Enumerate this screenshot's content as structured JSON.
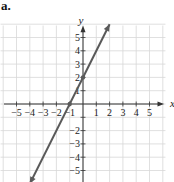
{
  "figure": {
    "label": "a."
  },
  "chart_data": {
    "type": "line",
    "title": "",
    "xlabel": "x",
    "ylabel": "y",
    "xlim": [
      -5.5,
      5.5
    ],
    "ylim": [
      -5.5,
      5.5
    ],
    "grid": true,
    "x_ticks": [
      -5,
      -4,
      -3,
      -2,
      -1,
      1,
      2,
      3,
      4,
      5
    ],
    "y_ticks": [
      -5,
      -4,
      -3,
      -2,
      -1,
      1,
      2,
      3,
      4,
      5
    ],
    "x_tick_labels": [
      "−5",
      "−4",
      "−3",
      "−2",
      "−1",
      "1",
      "2",
      "3",
      "4",
      "5"
    ],
    "y_tick_labels": [
      "−5",
      "−4",
      "−3",
      "−2",
      "−1",
      "1",
      "2",
      "3",
      "4",
      "5"
    ],
    "series": [
      {
        "name": "y = 2x + 2",
        "equation": "y = 2x + 2",
        "slope": 2,
        "intercept": 2,
        "x": [
          -4,
          -1,
          0,
          2
        ],
        "y": [
          -6,
          0,
          2,
          6
        ],
        "arrows_both_ends": true,
        "marked_points": [
          {
            "x": -1,
            "y": 0
          },
          {
            "x": 0,
            "y": 2
          }
        ]
      }
    ],
    "colors": {
      "line": "#5a5a5a",
      "grid": "#d8d8d8",
      "axis": "#333333"
    }
  }
}
